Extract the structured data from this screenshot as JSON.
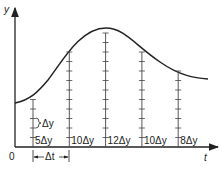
{
  "diagram": {
    "y_axis_label": "y",
    "x_axis_label": "t",
    "origin_label": "0",
    "delta_t_label": "Δt",
    "delta_y_label": "Δy",
    "strips": [
      {
        "label": "5Δy",
        "ticks": 5
      },
      {
        "label": "10Δy",
        "ticks": 10
      },
      {
        "label": "12Δy",
        "ticks": 12
      },
      {
        "label": "10Δy",
        "ticks": 10
      },
      {
        "label": "8Δy",
        "ticks": 8
      }
    ],
    "colors": {
      "ink": "#222222"
    }
  }
}
